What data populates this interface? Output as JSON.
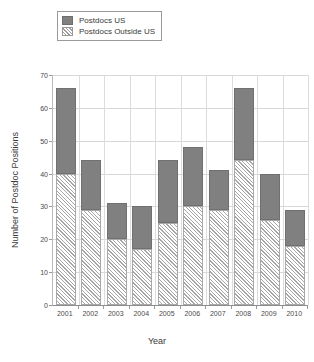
{
  "chart_data": {
    "type": "bar",
    "subtype": "stacked-vertical",
    "title": "",
    "xlabel": "Year",
    "ylabel": "Number of Postdoc Positions",
    "categories": [
      "2001",
      "2002",
      "2003",
      "2004",
      "2005",
      "2006",
      "2007",
      "2008",
      "2009",
      "2010"
    ],
    "series": [
      {
        "name": "Postdocs Outside US",
        "values": [
          40,
          29,
          20,
          17,
          25,
          30,
          29,
          44,
          26,
          18
        ],
        "style": "hatched-diagonal",
        "color": "#ffffff",
        "hatch_color": "#a6a6a6"
      },
      {
        "name": "Postdocs US",
        "values": [
          26,
          15,
          11,
          13,
          19,
          18,
          12,
          22,
          14,
          11
        ],
        "style": "solid",
        "color": "#808080"
      }
    ],
    "totals": [
      66,
      44,
      31,
      30,
      44,
      48,
      41,
      66,
      40,
      29
    ],
    "ylim": [
      0,
      70
    ],
    "yticks": [
      0,
      10,
      20,
      30,
      40,
      50,
      60,
      70
    ],
    "ytick_labels": [
      "0",
      "10",
      "20",
      "30",
      "40",
      "50",
      "60",
      "70"
    ],
    "grid": true,
    "grid_axis": "both",
    "legend_position": "top-left",
    "legend_entries": [
      "Postdocs US",
      "Postdocs Outside US"
    ],
    "stack_order_bottom_to_top": [
      "Postdocs Outside US",
      "Postdocs US"
    ]
  },
  "legend": {
    "items": [
      {
        "label": "Postdocs US",
        "swatch": "solid-gray-swatch"
      },
      {
        "label": "Postdocs Outside US",
        "swatch": "hatched-swatch"
      }
    ]
  },
  "axes": {
    "y_title": "Number of Postdoc Positions",
    "x_title": "Year"
  }
}
